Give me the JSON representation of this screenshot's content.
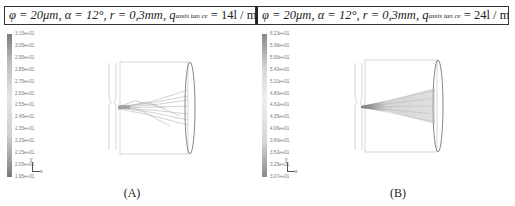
{
  "header": {
    "left": {
      "phi": "φ = 20μm,",
      "alpha": "α = 12°,",
      "r": "r = 0,3mm,",
      "q": "q",
      "q_sub": "assis tan ce",
      "q_val": "= 14l / min"
    },
    "right": {
      "phi": "φ = 20μm,",
      "alpha": "α = 12°,",
      "r": "r = 0,3mm,",
      "q": "q",
      "q_sub": "assis tan ce",
      "q_val": "= 24l / min"
    }
  },
  "panels": [
    {
      "caption": "(A)",
      "colorbar": [
        "3.15e+01",
        "3.05e+01",
        "2.95e+01",
        "2.85e+01",
        "2.75e+01",
        "2.65e+01",
        "2.55e+01",
        "2.45e+01",
        "2.35e+01",
        "2.25e+01",
        "2.15e+01",
        "2.05e+01",
        "1.95e+01"
      ],
      "axis_labels": {
        "x": "x",
        "y": "y"
      }
    },
    {
      "caption": "(B)",
      "colorbar": [
        "6.23e+01",
        "5.98e+01",
        "5.68e+01",
        "5.40e+01",
        "5.10e+01",
        "4.80e+01",
        "4.62e+01",
        "4.35e+01",
        "4.06e+01",
        "3.80e+01",
        "3.52e+01",
        "3.25e+01",
        "3.07e+01"
      ],
      "axis_labels": {
        "x": "x",
        "y": "y"
      }
    }
  ]
}
